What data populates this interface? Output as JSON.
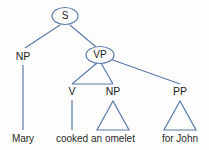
{
  "figure": {
    "kind": "syntax-tree",
    "colors": {
      "edge": "#5a7aaa",
      "ellipse_stroke": "#5a7aaa",
      "text": "#1c1c1c",
      "background": "#fdfdfd"
    }
  },
  "nodes": {
    "s": {
      "label": "S",
      "shape": "ellipse",
      "x": 65,
      "y": 16
    },
    "np_subject": {
      "label": "NP",
      "shape": "plain",
      "x": 23,
      "y": 57
    },
    "vp": {
      "label": "VP",
      "shape": "ellipse",
      "x": 100,
      "y": 55
    },
    "v": {
      "label": "V",
      "shape": "plain",
      "x": 72,
      "y": 92
    },
    "np_object": {
      "label": "NP",
      "shape": "plain",
      "x": 113,
      "y": 92
    },
    "pp": {
      "label": "PP",
      "shape": "plain",
      "x": 180,
      "y": 92
    }
  },
  "leaves": [
    {
      "name": "leaf-mary",
      "text": "Mary",
      "x": 23,
      "y": 140,
      "parent": "np_subject",
      "connector": "line"
    },
    {
      "name": "leaf-cooked",
      "text": "cooked",
      "x": 72,
      "y": 140,
      "parent": "v",
      "connector": "line"
    },
    {
      "name": "leaf-an-omelet",
      "text": "an omelet",
      "x": 113,
      "y": 140,
      "parent": "np_object",
      "connector": "triangle"
    },
    {
      "name": "leaf-for-john",
      "text": "for   John",
      "x": 180,
      "y": 140,
      "parent": "pp",
      "connector": "triangle"
    }
  ],
  "edges": [
    {
      "name": "edge-s-np",
      "from": "s",
      "to": "np_subject"
    },
    {
      "name": "edge-s-vp",
      "from": "s",
      "to": "vp"
    },
    {
      "name": "edge-vp-v",
      "from": "vp",
      "to": "v"
    },
    {
      "name": "edge-vp-np",
      "from": "vp",
      "to": "np_object"
    },
    {
      "name": "edge-vp-pp",
      "from": "vp",
      "to": "pp"
    },
    {
      "name": "edge-v-np-bar",
      "from": "v",
      "to": "np_object"
    }
  ]
}
